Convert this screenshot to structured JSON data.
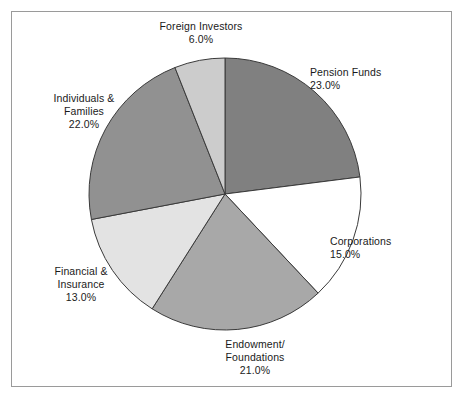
{
  "chart_data": {
    "type": "pie",
    "title": "",
    "subtitle": "",
    "xlabel": "",
    "ylabel": "",
    "legend_position": "none",
    "grid": false,
    "label_style": "outside",
    "start_angle_deg": 0,
    "direction": "clockwise",
    "categories": [
      "Pension Funds",
      "Corporations",
      "Endowment/ Foundations",
      "Financial & Insurance",
      "Individuals & Families",
      "Foreign Investors"
    ],
    "values": [
      23.0,
      15.0,
      21.0,
      13.0,
      22.0,
      6.0
    ],
    "value_labels": [
      "23.0%",
      "15.0%",
      "21.0%",
      "13.0%",
      "22.0%",
      "6.0%"
    ],
    "units": "percent",
    "total": 100.0,
    "slices": [
      {
        "name": "pension-funds",
        "label_lines": [
          "Pension Funds"
        ],
        "value_text": "23.0%",
        "value": 23.0,
        "color": "#808080",
        "stroke": "#3a3a3a"
      },
      {
        "name": "corporations",
        "label_lines": [
          "Corporations"
        ],
        "value_text": "15.0%",
        "value": 15.0,
        "color": "#ffffff",
        "stroke": "#3a3a3a"
      },
      {
        "name": "endowment-foundations",
        "label_lines": [
          "Endowment/",
          "Foundations"
        ],
        "value_text": "21.0%",
        "value": 21.0,
        "color": "#a8a8a8",
        "stroke": "#3a3a3a"
      },
      {
        "name": "financial-insurance",
        "label_lines": [
          "Financial &",
          "Insurance"
        ],
        "value_text": "13.0%",
        "value": 13.0,
        "color": "#e3e3e3",
        "stroke": "#3a3a3a"
      },
      {
        "name": "individuals-families",
        "label_lines": [
          "Individuals &",
          "Families"
        ],
        "value_text": "22.0%",
        "value": 22.0,
        "color": "#919191",
        "stroke": "#3a3a3a"
      },
      {
        "name": "foreign-investors",
        "label_lines": [
          "Foreign Investors"
        ],
        "value_text": "6.0%",
        "value": 6.0,
        "color": "#cccccc",
        "stroke": "#3a3a3a"
      }
    ]
  },
  "labels": {
    "pension_funds": {
      "line1": "Pension Funds",
      "line2": "23.0%"
    },
    "corporations": {
      "line1": "Corporations",
      "line2": "15.0%"
    },
    "endowment_foundations": {
      "line1": "Endowment/",
      "line2": "Foundations",
      "line3": "21.0%"
    },
    "financial_insurance": {
      "line1": "Financial &",
      "line2": "Insurance",
      "line3": "13.0%"
    },
    "individuals_families": {
      "line1": "Individuals &",
      "line2": "Families",
      "line3": "22.0%"
    },
    "foreign_investors": {
      "line1": "Foreign Investors",
      "line2": "6.0%"
    }
  },
  "geometry": {
    "center_x": 225,
    "center_y": 194,
    "radius": 136
  },
  "colors": {
    "background": "#ffffff",
    "frame_border": "#9a9a9a",
    "slice_outline": "#3a3a3a",
    "label_text": "#1a1a1a"
  }
}
